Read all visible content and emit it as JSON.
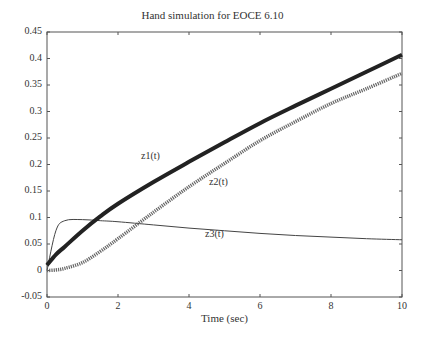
{
  "chart_data": {
    "type": "line",
    "title": "Hand simulation for EOCE 6.10",
    "xlabel": "Time (sec)",
    "ylabel": "",
    "xlim": [
      0,
      10
    ],
    "ylim": [
      -0.05,
      0.45
    ],
    "grid": false,
    "legend": "none (inline curve labels)",
    "x_ticks": [
      "0",
      "2",
      "4",
      "6",
      "8",
      "10"
    ],
    "y_ticks": [
      "-0.05",
      "0",
      "0.05",
      "0.1",
      "0.15",
      "0.2",
      "0.25",
      "0.3",
      "0.35",
      "0.4",
      "0.45"
    ],
    "x": [
      0,
      0.25,
      0.5,
      1,
      1.5,
      2,
      3,
      4,
      5,
      6,
      7,
      8,
      9,
      10
    ],
    "series": [
      {
        "name": "z1(t)",
        "style": "thick dotted marker line",
        "values": [
          0.01,
          0.03,
          0.045,
          0.075,
          0.102,
          0.126,
          0.167,
          0.205,
          0.242,
          0.278,
          0.311,
          0.343,
          0.375,
          0.407
        ]
      },
      {
        "name": "z2(t)",
        "style": "plus marker line",
        "values": [
          0.0,
          0.001,
          0.004,
          0.015,
          0.036,
          0.06,
          0.11,
          0.158,
          0.202,
          0.245,
          0.281,
          0.315,
          0.343,
          0.372
        ]
      },
      {
        "name": "z3(t)",
        "style": "thin solid line",
        "values": [
          0.0,
          0.075,
          0.094,
          0.096,
          0.094,
          0.092,
          0.086,
          0.08,
          0.075,
          0.07,
          0.066,
          0.063,
          0.06,
          0.058
        ]
      }
    ],
    "annotations": [
      {
        "text": "z1(t)",
        "x": 2.6,
        "y": 0.19
      },
      {
        "text": "z2(t)",
        "x": 4.4,
        "y": 0.145
      },
      {
        "text": "z3(t)",
        "x": 4.5,
        "y": 0.078
      }
    ]
  }
}
